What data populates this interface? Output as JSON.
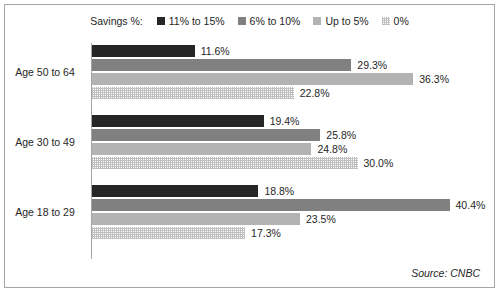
{
  "legend": {
    "title": "Savings %:",
    "entries": [
      {
        "label": "11% to 15%",
        "color": "#262626",
        "pattern": "solid"
      },
      {
        "label": "6% to 10%",
        "color": "#808080",
        "pattern": "solid"
      },
      {
        "label": "Up to 5%",
        "color": "#b3b3b3",
        "pattern": "solid"
      },
      {
        "label": "0%",
        "color": "#bfbfbf",
        "pattern": "dotted"
      }
    ]
  },
  "source_note": "Source: CNBC",
  "chart_data": {
    "type": "bar",
    "orientation": "horizontal",
    "title": "",
    "xlabel": "",
    "ylabel": "",
    "grid": false,
    "legend_position": "top-center",
    "axis_max": 45,
    "categories": [
      "Age 50 to 64",
      "Age 30 to 49",
      "Age 18 to 29"
    ],
    "series": [
      {
        "name": "11% to 15%",
        "color": "#262626",
        "values": [
          11.6,
          19.4,
          18.8
        ]
      },
      {
        "name": "6% to 10%",
        "color": "#808080",
        "values": [
          29.3,
          25.8,
          40.4
        ]
      },
      {
        "name": "Up to 5%",
        "color": "#b3b3b3",
        "values": [
          36.3,
          24.8,
          23.5
        ]
      },
      {
        "name": "0%",
        "color": "#bfbfbf",
        "values": [
          22.8,
          30.0,
          17.3
        ]
      }
    ],
    "value_labels": [
      [
        "11.6%",
        "29.3%",
        "36.3%",
        "22.8%"
      ],
      [
        "19.4%",
        "25.8%",
        "24.8%",
        "30.0%"
      ],
      [
        "18.8%",
        "40.4%",
        "23.5%",
        "17.3%"
      ]
    ]
  }
}
